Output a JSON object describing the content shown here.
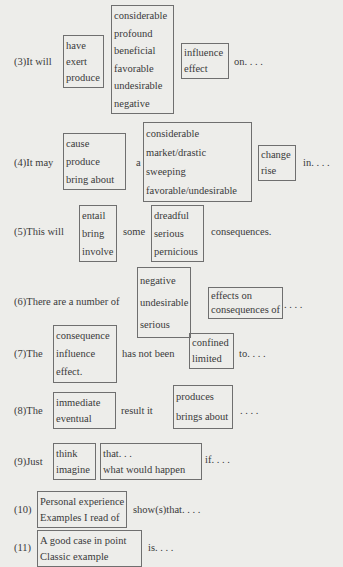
{
  "rows": [
    {
      "id": "3",
      "lead": "(3)It will",
      "box1": [
        "have",
        "exert",
        "produce"
      ],
      "box2": [
        "considerable",
        "profound",
        "beneficial",
        "favorable",
        "undesirable",
        "negative"
      ],
      "box3": [
        "influence",
        "effect"
      ],
      "tail": "on. . . ."
    },
    {
      "id": "4",
      "lead": "(4)It may",
      "box1": [
        "cause",
        "produce",
        "bring about"
      ],
      "mid": "a",
      "box2": [
        "considerable",
        "market/drastic",
        "sweeping",
        "favorable/undesirable"
      ],
      "box3": [
        "change",
        "rise"
      ],
      "tail": "in. . . ."
    },
    {
      "id": "5",
      "lead": "(5)This will",
      "box1": [
        "entail",
        "bring",
        "involve"
      ],
      "mid": "some",
      "box2": [
        "dreadful",
        "serious",
        "pernicious"
      ],
      "tail": "consequences."
    },
    {
      "id": "6",
      "lead": "(6)There are a number of",
      "box1": [
        "negative",
        "undesirable",
        "serious"
      ],
      "box2": [
        "effects on",
        "consequences of"
      ],
      "tail": ". . . ."
    },
    {
      "id": "7",
      "lead": "(7)The",
      "box1": [
        "consequence",
        "influence",
        "effect."
      ],
      "mid": "has not been",
      "box2": [
        "confined",
        "limited"
      ],
      "tail": "to. . . ."
    },
    {
      "id": "8",
      "lead": "(8)The",
      "box1": [
        "immediate",
        "eventual"
      ],
      "mid": "result it",
      "box2": [
        "produces",
        "brings about"
      ],
      "tail": ". . . ."
    },
    {
      "id": "9",
      "lead": "(9)Just",
      "box1": [
        "think",
        "imagine"
      ],
      "box2": [
        "that. . .",
        "what would happen"
      ],
      "tail": "if. . . ."
    },
    {
      "id": "10",
      "lead": "(10)",
      "box1": [
        "Personal experience",
        "Examples I read of"
      ],
      "tail": "show(s)that. . . ."
    },
    {
      "id": "11",
      "lead": "(11)",
      "box1": [
        "A good case in point",
        "Classic example"
      ],
      "tail": "is. . . ."
    }
  ]
}
